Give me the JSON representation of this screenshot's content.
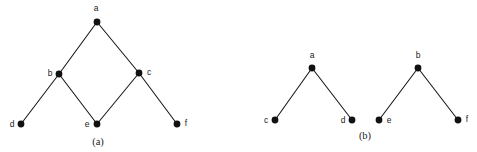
{
  "figure": {
    "background_color": "#ffffff",
    "ink_color": "#1a1a1a",
    "vertex_color": "#111111",
    "width": 477,
    "height": 152,
    "panels": [
      {
        "id": "panel-a",
        "caption": "(a)",
        "caption_x": 98,
        "caption_y": 145,
        "description": "single connected graph with a diamond cycle",
        "vertices": [
          {
            "id": "a",
            "label": "a",
            "x": 97,
            "y": 22,
            "r": 3.4,
            "label_x": 96,
            "label_y": 11,
            "label_anchor": "middle"
          },
          {
            "id": "b",
            "label": "b",
            "x": 59,
            "y": 74,
            "r": 3.4,
            "label_x": 50,
            "label_y": 76,
            "label_anchor": "middle"
          },
          {
            "id": "c",
            "label": "c",
            "x": 139,
            "y": 73,
            "r": 3.4,
            "label_x": 149,
            "label_y": 75,
            "label_anchor": "middle"
          },
          {
            "id": "d",
            "label": "d",
            "x": 21,
            "y": 124,
            "r": 3.4,
            "label_x": 12,
            "label_y": 127,
            "label_anchor": "middle"
          },
          {
            "id": "e",
            "label": "e",
            "x": 97,
            "y": 124,
            "r": 3.4,
            "label_x": 87,
            "label_y": 127,
            "label_anchor": "middle"
          },
          {
            "id": "f",
            "label": "f",
            "x": 177,
            "y": 124,
            "r": 3.4,
            "label_x": 186,
            "label_y": 126,
            "label_anchor": "middle"
          }
        ],
        "edges": [
          {
            "id": "a-b",
            "from": "a",
            "to": "b"
          },
          {
            "id": "a-c",
            "from": "a",
            "to": "c"
          },
          {
            "id": "b-d",
            "from": "b",
            "to": "d"
          },
          {
            "id": "b-e",
            "from": "b",
            "to": "e"
          },
          {
            "id": "c-e",
            "from": "c",
            "to": "e"
          },
          {
            "id": "c-f",
            "from": "c",
            "to": "f"
          }
        ]
      },
      {
        "id": "panel-b",
        "caption": "(b)",
        "caption_x": 365,
        "caption_y": 139,
        "description": "two disjoint two-level trees",
        "vertices": [
          {
            "id": "a",
            "label": "a",
            "x": 312,
            "y": 68,
            "r": 3.4,
            "label_x": 312,
            "label_y": 58,
            "label_anchor": "middle"
          },
          {
            "id": "b",
            "label": "b",
            "x": 418,
            "y": 68,
            "r": 3.4,
            "label_x": 418,
            "label_y": 58,
            "label_anchor": "middle"
          },
          {
            "id": "c",
            "label": "c",
            "x": 275,
            "y": 120,
            "r": 3.4,
            "label_x": 266,
            "label_y": 123,
            "label_anchor": "middle"
          },
          {
            "id": "d",
            "label": "d",
            "x": 352,
            "y": 120,
            "r": 3.4,
            "label_x": 343,
            "label_y": 123,
            "label_anchor": "middle"
          },
          {
            "id": "e",
            "label": "e",
            "x": 379,
            "y": 120,
            "r": 3.4,
            "label_x": 389,
            "label_y": 123,
            "label_anchor": "middle"
          },
          {
            "id": "f",
            "label": "f",
            "x": 458,
            "y": 120,
            "r": 3.4,
            "label_x": 467,
            "label_y": 122,
            "label_anchor": "middle"
          }
        ],
        "edges": [
          {
            "id": "a-c",
            "from": "a",
            "to": "c"
          },
          {
            "id": "a-d",
            "from": "a",
            "to": "d"
          },
          {
            "id": "b-e",
            "from": "b",
            "to": "e"
          },
          {
            "id": "b-f",
            "from": "b",
            "to": "f"
          }
        ]
      }
    ]
  }
}
